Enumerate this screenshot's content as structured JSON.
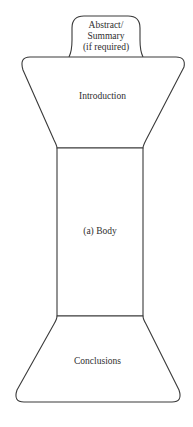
{
  "diagram": {
    "type": "hourglass-document-structure",
    "sections": [
      {
        "id": "abstract",
        "lines": [
          "Abstract/",
          "Summary",
          "(if required)"
        ]
      },
      {
        "id": "introduction",
        "label": "Introduction"
      },
      {
        "id": "body",
        "label": "(a) Body"
      },
      {
        "id": "conclusions",
        "label": "Conclusions"
      }
    ],
    "colors": {
      "stroke": "#3a3a3a",
      "fill": "#ffffff",
      "text": "#2e2e2e"
    }
  }
}
